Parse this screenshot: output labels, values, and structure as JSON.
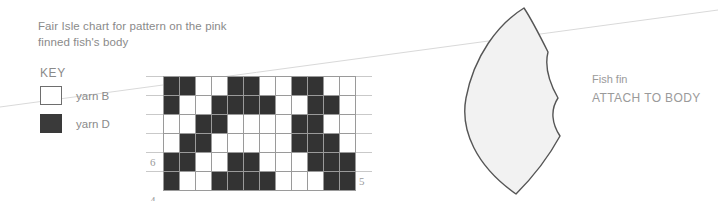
{
  "title": {
    "line1": "Fair Isle chart for pattern on the pink",
    "line2": "finned fish's body",
    "full": "Fair Isle chart for pattern on the pink finned fish's body"
  },
  "key": {
    "heading": "KEY",
    "items": [
      {
        "label": "yarn B",
        "code": "B",
        "color": "#ffffff",
        "swatch": "white-square-swatch"
      },
      {
        "label": "yarn D",
        "code": "D",
        "color": "#333333",
        "swatch": "dark-square-swatch"
      }
    ]
  },
  "chart": {
    "columns": 12,
    "rows": 6,
    "row_labels_left": [
      "6",
      "4",
      "2"
    ],
    "row_labels_right": [
      "5",
      "3",
      "1"
    ],
    "grid_line_color": "#9a9a9a",
    "rows_top_to_bottom": [
      {
        "number": "6",
        "cells": [
          "D",
          "D",
          "B",
          "B",
          "D",
          "D",
          "B",
          "B",
          "D",
          "D",
          "B",
          "B"
        ]
      },
      {
        "number": "5",
        "cells": [
          "D",
          "B",
          "B",
          "D",
          "D",
          "D",
          "D",
          "B",
          "B",
          "D",
          "D",
          "B"
        ]
      },
      {
        "number": "4",
        "cells": [
          "B",
          "B",
          "D",
          "D",
          "B",
          "B",
          "B",
          "B",
          "D",
          "D",
          "B",
          "B"
        ]
      },
      {
        "number": "3",
        "cells": [
          "B",
          "D",
          "D",
          "B",
          "B",
          "B",
          "B",
          "B",
          "D",
          "D",
          "D",
          "B"
        ]
      },
      {
        "number": "2",
        "cells": [
          "D",
          "D",
          "B",
          "B",
          "D",
          "D",
          "B",
          "B",
          "B",
          "D",
          "D",
          "D"
        ]
      },
      {
        "number": "1",
        "cells": [
          "D",
          "B",
          "B",
          "D",
          "D",
          "D",
          "D",
          "B",
          "B",
          "B",
          "D",
          "D"
        ]
      }
    ]
  },
  "fin_piece": {
    "name": "Fish fin",
    "instruction": "ATTACH TO BODY",
    "fill": "#f2f2f2",
    "stroke": "#555555"
  }
}
